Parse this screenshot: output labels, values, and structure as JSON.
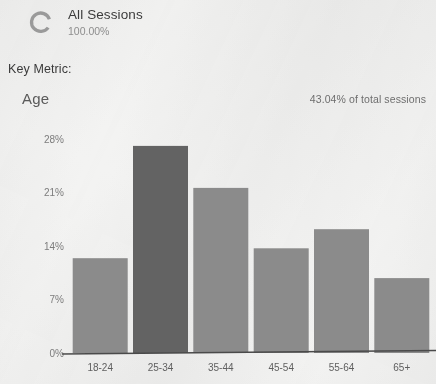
{
  "segment": {
    "icon": "donut-ring-icon",
    "name": "All Sessions",
    "percent": "100.00%"
  },
  "key_metric_label": "Key Metric:",
  "report": {
    "dimension_title": "Age",
    "total_note": "43.04% of total sessions"
  },
  "colors": {
    "background": "#f3f3f2",
    "bar_default": "#8b8b8b",
    "bar_highlight": "#636363",
    "axis": "#4a4a4a",
    "tick_text": "#7c7c7c"
  },
  "chart_data": {
    "type": "bar",
    "title": "Age",
    "xlabel": "",
    "ylabel": "",
    "categories": [
      "18-24",
      "25-34",
      "35-44",
      "45-54",
      "55-64",
      "65+"
    ],
    "values": [
      12.4,
      27.1,
      21.6,
      13.7,
      16.2,
      9.8
    ],
    "value_labels": [
      "12.4%",
      "27.1%",
      "21.6%",
      "13.7%",
      "16.2%",
      "9.8%"
    ],
    "ylim": [
      0,
      28
    ],
    "yticks": [
      0,
      7,
      14,
      21,
      28
    ],
    "ytick_labels": [
      "0%",
      "7%",
      "14%",
      "21%",
      "28%"
    ],
    "grid": false,
    "legend": false,
    "highlighted_category": "25-34",
    "bar_colors": [
      "#8b8b8b",
      "#636363",
      "#8b8b8b",
      "#8b8b8b",
      "#8b8b8b",
      "#8b8b8b"
    ]
  }
}
